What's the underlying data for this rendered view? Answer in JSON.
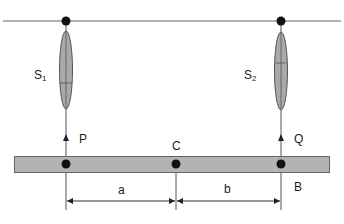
{
  "diagram": {
    "type": "spring-supported beam",
    "colors": {
      "line": "#555555",
      "dot": "#111111",
      "spring_fill": "#a9a9a9",
      "spring_stroke": "#555555",
      "beam_fill": "#b3b3b3",
      "beam_stroke": "#666666",
      "text": "#1a1a1a"
    },
    "labels": {
      "spring_left": "S",
      "spring_left_sub": "1",
      "spring_right": "S",
      "spring_right_sub": "2",
      "point_left": "P",
      "point_right": "Q",
      "point_center": "C",
      "point_bottom_right": "B",
      "dim_left": "a",
      "dim_right": "b"
    }
  }
}
